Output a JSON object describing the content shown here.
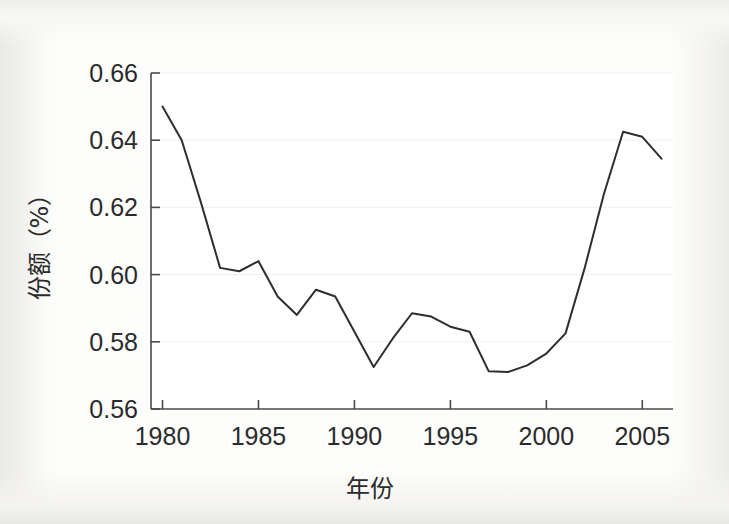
{
  "chart_data": {
    "type": "line",
    "title": "",
    "xlabel": "年份",
    "ylabel": "份额（%）",
    "xlim": [
      1979.4,
      2006.6
    ],
    "ylim": [
      0.56,
      0.66
    ],
    "xticks": [
      1980,
      1985,
      1990,
      1995,
      2000,
      2005
    ],
    "xtick_labels": [
      "1980",
      "1985",
      "1990",
      "1995",
      "2000",
      "2005"
    ],
    "yticks": [
      0.56,
      0.58,
      0.6,
      0.62,
      0.64,
      0.66
    ],
    "ytick_labels": [
      "0.56",
      "0.58",
      "0.60",
      "0.62",
      "0.64",
      "0.66"
    ],
    "grid": true,
    "legend": null,
    "series": [
      {
        "name": "份额",
        "color": "#2e2e2e",
        "x": [
          1980,
          1981,
          1982,
          1983,
          1984,
          1985,
          1986,
          1987,
          1988,
          1989,
          1990,
          1991,
          1992,
          1993,
          1994,
          1995,
          1996,
          1997,
          1998,
          1999,
          2000,
          2001,
          2002,
          2003,
          2004,
          2005,
          2006
        ],
        "values": [
          0.65,
          0.64,
          0.6215,
          0.602,
          0.601,
          0.604,
          0.5935,
          0.588,
          0.5955,
          0.5935,
          0.583,
          0.5725,
          0.581,
          0.5885,
          0.5875,
          0.5845,
          0.583,
          0.5712,
          0.571,
          0.573,
          0.5765,
          0.5825,
          0.602,
          0.624,
          0.6425,
          0.641,
          0.6345
        ]
      }
    ]
  },
  "axis": {
    "x_title": "年份",
    "y_title": "份额（%）"
  }
}
